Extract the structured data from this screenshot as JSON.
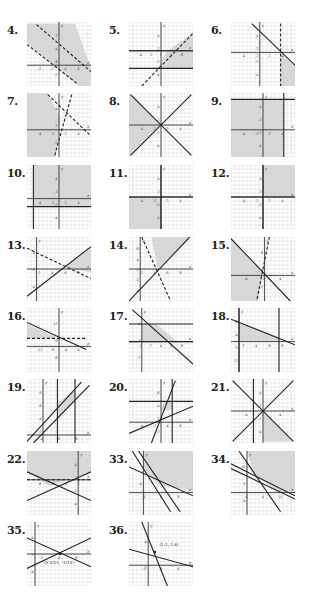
{
  "page": {
    "colors": {
      "shade": "#d9d9d9",
      "grid": "#d0d0d0",
      "line": "#222222",
      "background": "#ffffff"
    }
  },
  "exercises": [
    {
      "number": "4.",
      "x_ticks": [
        "-2",
        "2",
        "4",
        "6"
      ],
      "y_ticks": [
        "2",
        "4",
        "6",
        "-2"
      ],
      "solution_note": "band between two parallel dashed lines, shaded"
    },
    {
      "number": "5.",
      "x_ticks": [
        "-4",
        "-2",
        "2",
        "4",
        "6"
      ],
      "y_ticks": [
        "4",
        "2",
        "-2",
        "-4"
      ],
      "solution_note": "region below dashed line above horizontal solid line"
    },
    {
      "number": "6.",
      "x_ticks": [
        "-4",
        "-2",
        "2",
        "4"
      ],
      "y_ticks": [
        "4",
        "2",
        "-2",
        "-4"
      ],
      "solution_note": "below solid line, right of dashed vertical x=3"
    },
    {
      "number": "7.",
      "x_ticks": [
        "-4",
        "-2",
        "2",
        "4"
      ],
      "y_ticks": [
        "4",
        "2",
        "-2"
      ],
      "solution_note": "left of two dashed lines"
    },
    {
      "number": "8.",
      "x_ticks": [
        "-4",
        "-2",
        "2",
        "4"
      ],
      "y_ticks": [
        "4",
        "2",
        "-2",
        "-4"
      ],
      "solution_note": "left wedge between y=x and y=-x"
    },
    {
      "number": "9.",
      "x_ticks": [
        "-4",
        "-2",
        "2",
        "4"
      ],
      "y_ticks": [
        "4",
        "2",
        "-2",
        "-4"
      ],
      "solution_note": "below y=5, left of x=4"
    },
    {
      "number": "10.",
      "x_ticks": [
        "-4",
        "-2",
        "2",
        "4"
      ],
      "y_ticks": [
        "4",
        "2",
        "-2",
        "-4"
      ],
      "solution_note": "above y=-2, right of x=-5"
    },
    {
      "number": "11.",
      "x_ticks": [
        "-4",
        "-2",
        "2",
        "4"
      ],
      "y_ticks": [
        "4",
        "2",
        "-2",
        "-4"
      ],
      "solution_note": "third quadrant x<=0, y<=0"
    },
    {
      "number": "12.",
      "x_ticks": [
        "-4",
        "-2",
        "2",
        "4"
      ],
      "y_ticks": [
        "4",
        "2",
        "-2",
        "-4"
      ],
      "solution_note": "first quadrant x>=0, y>=0"
    },
    {
      "number": "13.",
      "x_ticks": [
        "2",
        "4",
        "6",
        "8"
      ],
      "y_ticks": [
        "4",
        "-2",
        "-4"
      ],
      "solution_note": "region right of intersection between solid and dashed lines"
    },
    {
      "number": "14.",
      "x_ticks": [
        "-2",
        "4",
        "6",
        "8"
      ],
      "y_ticks": [
        "6",
        "4",
        "2",
        "-2",
        "-4"
      ],
      "solution_note": "upper wedge between solid and dashed lines"
    },
    {
      "number": "15.",
      "x_ticks": [
        "-4",
        "-2",
        "4"
      ],
      "y_ticks": [
        "6",
        "4",
        "2"
      ],
      "solution_note": "left region below solid line and left of dashed line"
    },
    {
      "number": "16.",
      "x_ticks": [
        "-12",
        "-8",
        "-4",
        "4"
      ],
      "y_ticks": [
        "12",
        "8",
        "-8"
      ],
      "solution_note": "small wedge between solid line and dashed horizontal"
    },
    {
      "number": "17.",
      "x_ticks": [
        "-2",
        "2",
        "4",
        "6",
        "8"
      ],
      "y_ticks": [
        "4",
        "2",
        "-2"
      ],
      "solution_note": "polygon in first quadrant bounded by y=3 and diagonal"
    },
    {
      "number": "18.",
      "x_ticks": [
        "2",
        "4",
        "6",
        "8"
      ],
      "y_ticks": [
        "6",
        "4",
        "2",
        "-2"
      ],
      "solution_note": "triangle-like region bounded by line, x=0, x=6, y=0"
    },
    {
      "number": "19.",
      "x_ticks": [
        "4",
        "6",
        "8"
      ],
      "y_ticks": [
        "8",
        "6",
        "4",
        "2"
      ],
      "solution_note": "parallelogram between two parallel lines and verticals x=2, x=5"
    },
    {
      "number": "20.",
      "x_ticks": [
        "-4",
        "-2",
        "4",
        "6"
      ],
      "y_ticks": [
        "6",
        "4",
        "2",
        "-2"
      ],
      "solution_note": "small region between lines and y=2"
    },
    {
      "number": "21.",
      "x_ticks": [
        "-4",
        "2",
        "4"
      ],
      "y_ticks": [
        "4",
        "2",
        "-2",
        "-4"
      ],
      "solution_note": "lower wedge between y=x and y=-x, right of x"
    },
    {
      "number": "22.",
      "x_ticks": [
        "-8",
        "-6",
        "-2",
        "2"
      ],
      "y_ticks": [
        "4",
        "2",
        "-2",
        "-4"
      ],
      "solution_note": "region above both crossing lines"
    },
    {
      "number": "33.",
      "x_ticks": [
        "-4",
        "4",
        "8"
      ],
      "y_ticks": [
        "-4"
      ],
      "solution_note": "region above three lines in first quadrant"
    },
    {
      "number": "34.",
      "x_ticks": [
        "-4",
        "4",
        "10"
      ],
      "y_ticks": [
        "10",
        "5",
        "-4"
      ],
      "solution_note": "region above three lines in first quadrant"
    },
    {
      "number": "35.",
      "x_ticks": [
        "2",
        "4",
        "6"
      ],
      "y_ticks": [
        "4",
        "2",
        "-4"
      ],
      "annotation": "(5 5/11, -1/11)",
      "solution_note": "two lines intersecting"
    },
    {
      "number": "36.",
      "x_ticks": [
        "-2",
        "4",
        "6"
      ],
      "y_ticks": [
        "4",
        "-2"
      ],
      "annotation": "(1.2, 1.6)",
      "solution_note": "two lines intersecting"
    }
  ]
}
